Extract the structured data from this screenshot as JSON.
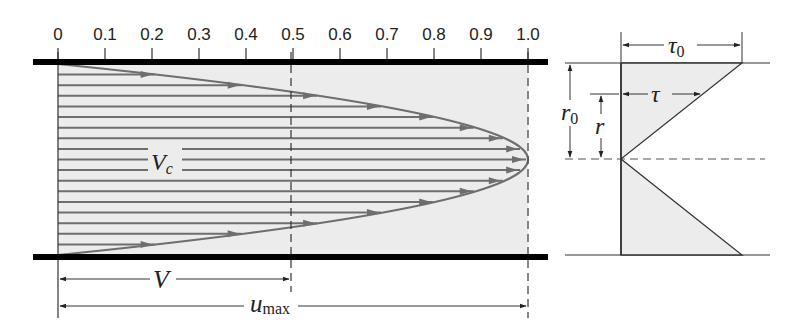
{
  "figure": {
    "axis": {
      "ticks": [
        "0",
        "0.1",
        "0.2",
        "0.3",
        "0.4",
        "0.5",
        "0.6",
        "0.7",
        "0.8",
        "0.9",
        "1.0"
      ],
      "x0": 58,
      "x1": 528
    },
    "pipe": {
      "top_y": 62,
      "bottom_y": 257,
      "left_x": 33,
      "right_x": 548,
      "center_y": 159.5
    },
    "colors": {
      "fill": "#ececec",
      "line": "#6e6e6e",
      "wall": "#000000",
      "text": "#222222"
    },
    "velocity_lines": 17,
    "labels": {
      "vc": "V",
      "vc_sub": "c",
      "v": "V",
      "umax": "u",
      "umax_sub": "max",
      "tau0": "τ",
      "tau0_sub": "0",
      "tau": "τ",
      "r0": "r",
      "r0_sub": "0",
      "r": "r"
    },
    "dimensions": {
      "V_fraction": 0.5,
      "umax_fraction": 1.0
    }
  }
}
